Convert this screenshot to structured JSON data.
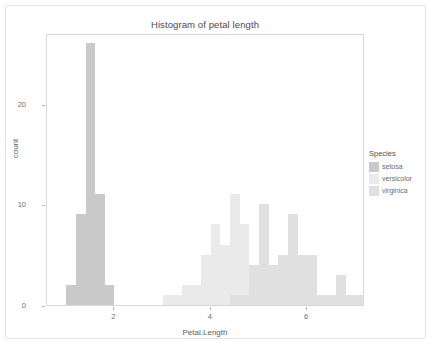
{
  "card": {
    "background": "#ffffff",
    "border_color": "#e3e3e3"
  },
  "plot": {
    "title": "Histogram of petal length",
    "xlabel": "Petal.Length",
    "ylabel": "count",
    "panel_border_color": "#d8d8d8"
  },
  "legend": {
    "title": "Species",
    "position": "right",
    "items": [
      {
        "label": "setosa",
        "color": "#c9c9c9"
      },
      {
        "label": "versicolor",
        "color": "#eaeaea"
      },
      {
        "label": "virginica",
        "color": "#e0e0e0"
      }
    ]
  },
  "bottom_caption": "",
  "chart_data": {
    "type": "bar",
    "subtype": "histogram-overlay",
    "title": "Histogram of petal length",
    "xlabel": "Petal.Length",
    "ylabel": "count",
    "xlim": [
      0.6,
      7.2
    ],
    "ylim": [
      0,
      27
    ],
    "xticks": [
      2,
      4,
      6
    ],
    "yticks": [
      0,
      10,
      20
    ],
    "grid": false,
    "legend_position": "right",
    "bin_width": 0.2,
    "series": [
      {
        "name": "setosa",
        "color": "#c9c9c9",
        "bins": [
          {
            "x0": 1.0,
            "x1": 1.2,
            "count": 2
          },
          {
            "x0": 1.2,
            "x1": 1.4,
            "count": 9
          },
          {
            "x0": 1.4,
            "x1": 1.6,
            "count": 26
          },
          {
            "x0": 1.6,
            "x1": 1.8,
            "count": 11
          },
          {
            "x0": 1.8,
            "x1": 2.0,
            "count": 2
          }
        ]
      },
      {
        "name": "versicolor",
        "color": "#eaeaea",
        "bins": [
          {
            "x0": 3.0,
            "x1": 3.2,
            "count": 1
          },
          {
            "x0": 3.2,
            "x1": 3.4,
            "count": 1
          },
          {
            "x0": 3.4,
            "x1": 3.6,
            "count": 2
          },
          {
            "x0": 3.6,
            "x1": 3.8,
            "count": 2
          },
          {
            "x0": 3.8,
            "x1": 4.0,
            "count": 5
          },
          {
            "x0": 4.0,
            "x1": 4.2,
            "count": 8
          },
          {
            "x0": 4.2,
            "x1": 4.4,
            "count": 6
          },
          {
            "x0": 4.4,
            "x1": 4.6,
            "count": 11
          },
          {
            "x0": 4.6,
            "x1": 4.8,
            "count": 8
          },
          {
            "x0": 4.8,
            "x1": 5.0,
            "count": 4
          },
          {
            "x0": 5.0,
            "x1": 5.2,
            "count": 1
          },
          {
            "x0": 5.2,
            "x1": 5.4,
            "count": 0
          }
        ]
      },
      {
        "name": "virginica",
        "color": "#e0e0e0",
        "bins": [
          {
            "x0": 4.4,
            "x1": 4.6,
            "count": 1
          },
          {
            "x0": 4.6,
            "x1": 4.8,
            "count": 1
          },
          {
            "x0": 4.8,
            "x1": 5.0,
            "count": 4
          },
          {
            "x0": 5.0,
            "x1": 5.2,
            "count": 10
          },
          {
            "x0": 5.2,
            "x1": 5.4,
            "count": 4
          },
          {
            "x0": 5.4,
            "x1": 5.6,
            "count": 5
          },
          {
            "x0": 5.6,
            "x1": 5.8,
            "count": 9
          },
          {
            "x0": 5.8,
            "x1": 6.0,
            "count": 5
          },
          {
            "x0": 6.0,
            "x1": 6.2,
            "count": 5
          },
          {
            "x0": 6.2,
            "x1": 6.4,
            "count": 1
          },
          {
            "x0": 6.4,
            "x1": 6.6,
            "count": 1
          },
          {
            "x0": 6.6,
            "x1": 6.8,
            "count": 3
          },
          {
            "x0": 6.8,
            "x1": 7.0,
            "count": 1
          },
          {
            "x0": 7.0,
            "x1": 7.2,
            "count": 1
          }
        ]
      }
    ]
  }
}
